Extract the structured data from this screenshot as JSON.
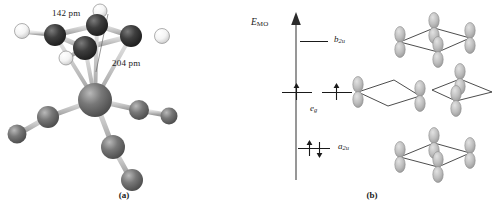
{
  "figure": {
    "panels": [
      {
        "id": "a",
        "caption": "(a)",
        "type": "ball-and-stick-molecular-model"
      },
      {
        "id": "b",
        "caption": "(b)",
        "type": "molecular-orbital-energy-diagram"
      }
    ]
  },
  "panel_a": {
    "caption": "(a)",
    "dimension_labels": [
      {
        "name": "ring-bond-length",
        "text": "142 pm"
      },
      {
        "name": "metal-ring-distance",
        "text": "204 pm"
      }
    ],
    "atoms": {
      "dark_color": "#3a3a3a",
      "mid_color": "#6e6e6e",
      "light_color": "#f2f2f2",
      "bond_color": "#c9c9c9"
    }
  },
  "panel_b": {
    "caption": "(b)",
    "axis": {
      "label_symbol": "E",
      "label_subscript": "MO"
    },
    "levels": [
      {
        "name": "b2u",
        "symbol": "b",
        "subscript": "2u",
        "electrons": 0,
        "spins": []
      },
      {
        "name": "eg",
        "symbol": "e",
        "subscript": "g",
        "electrons": 2,
        "spins": [
          "up",
          "up"
        ]
      },
      {
        "name": "a2u",
        "symbol": "a",
        "subscript": "2u",
        "electrons": 2,
        "spins": [
          "up",
          "down"
        ]
      }
    ],
    "orbital_pictures": [
      {
        "name": "b2u-orbital",
        "lobes": 4,
        "ring": "cyclobutadiene"
      },
      {
        "name": "eg-orbital-left",
        "lobes": 2,
        "ring": "cyclobutadiene"
      },
      {
        "name": "eg-orbital-right",
        "lobes": 2,
        "ring": "cyclobutadiene"
      },
      {
        "name": "a2u-orbital",
        "lobes": 4,
        "ring": "cyclobutadiene"
      }
    ],
    "orbital_color": "#b6b6b6",
    "orbital_edge_color": "#8c8c8c"
  }
}
